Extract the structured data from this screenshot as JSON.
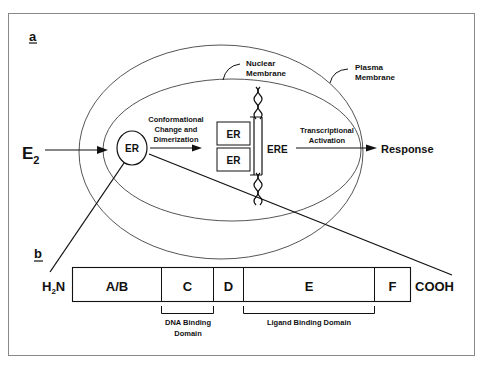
{
  "panels": {
    "a": {
      "label": "a",
      "ligand": "E",
      "ligand_subscript": "2",
      "receptor": "ER",
      "step1_line1": "Conformational",
      "step1_line2": "Change and",
      "step1_line3": "Dimerization",
      "dimer_top": "ER",
      "dimer_bottom": "ER",
      "response_element": "ERE",
      "step2_line1": "Transcriptional",
      "step2_line2": "Activation",
      "output": "Response",
      "nuclear_membrane_line1": "Nuclear",
      "nuclear_membrane_line2": "Membrane",
      "plasma_membrane_line1": "Plasma",
      "plasma_membrane_line2": "Membrane"
    },
    "b": {
      "label": "b",
      "n_terminus_H": "H",
      "n_terminus_sub": "2",
      "n_terminus_N": "N",
      "c_terminus": "COOH",
      "domains": [
        "A/B",
        "C",
        "D",
        "E",
        "F"
      ],
      "dna_binding_line1": "DNA Binding",
      "dna_binding_line2": "Domain",
      "ligand_binding": "Ligand Binding Domain"
    }
  },
  "colors": {
    "line": "#111111",
    "membrane": "#555555",
    "frame": "#888888"
  }
}
